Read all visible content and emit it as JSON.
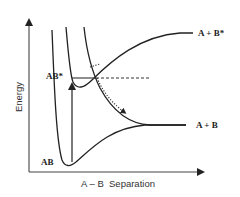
{
  "diagram": {
    "axes": {
      "y_label": "Energy",
      "x_label": "A – B  Separation"
    },
    "curves": [
      {
        "name": "ground-state",
        "label": "AB",
        "asymptote_label": "A + B"
      },
      {
        "name": "excited-state",
        "label": "AB*",
        "asymptote_label": "A + B*"
      },
      {
        "name": "repulsive-state",
        "label": "",
        "asymptote_label": "A + B"
      }
    ],
    "transitions": [
      {
        "type": "absorption",
        "from": "AB",
        "to": "AB*",
        "style": "solid-arrow"
      },
      {
        "type": "crossing-path",
        "style": "dotted-arrow"
      }
    ]
  }
}
